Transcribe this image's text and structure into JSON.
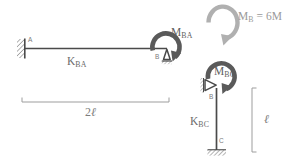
{
  "figure": {
    "background_color": "#ffffff",
    "ink_color": "#555555",
    "light_ink_color": "#a8a8a8"
  },
  "beam": {
    "node_a_label": "A",
    "node_b_label": "B",
    "stiffness_label_prefix": "K",
    "stiffness_label_sub": "BA",
    "moment_label_prefix": "M",
    "moment_label_sub": "BA",
    "support_a_type": "fixed-hatched-wall",
    "support_b_type": "pin-triangle",
    "moment_direction": "clockwise"
  },
  "column": {
    "node_b_label": "B",
    "node_c_label": "C",
    "stiffness_label_prefix": "K",
    "stiffness_label_sub": "BC",
    "moment_label_prefix": "M",
    "moment_label_sub": "BC",
    "support_b_type": "pin-triangle",
    "support_c_type": "fixed-hatched-base",
    "moment_direction": "clockwise"
  },
  "applied_moment": {
    "label_prefix": "M",
    "label_sub": "B",
    "label_equals": " = 6M",
    "direction": "clockwise",
    "color": "#a8a8a8"
  },
  "dimensions": {
    "span_beam": "2ℓ",
    "span_beam_number": "2",
    "span_beam_unit": "ℓ",
    "height_column": "ℓ"
  }
}
